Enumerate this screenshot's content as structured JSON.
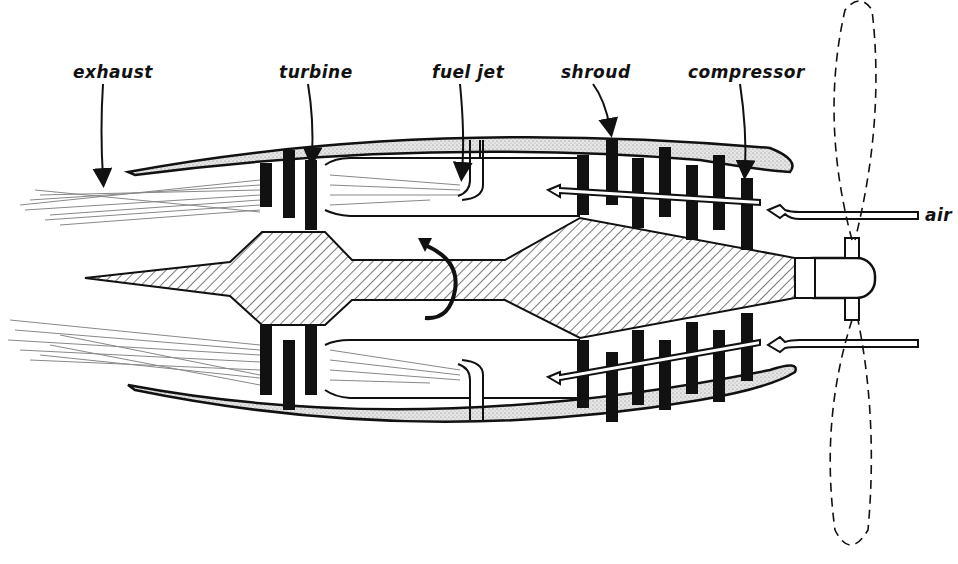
{
  "diagram": {
    "labels": {
      "exhaust": "exhaust",
      "turbine": "turbine",
      "fuel_jet": "fuel jet",
      "shroud": "shroud",
      "compressor": "compressor",
      "air": "air"
    },
    "colors": {
      "ink": "#111111",
      "background": "#ffffff",
      "stipple": "#9a9a9a"
    }
  }
}
